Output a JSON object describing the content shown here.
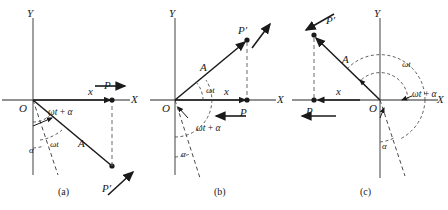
{
  "figure": {
    "background": "#ffffff",
    "ink": "#1a1a1a",
    "axis_color": "#6e6e6e",
    "width": 448,
    "height": 210
  },
  "common": {
    "axis_y_label": "Y",
    "axis_x_label": "X",
    "origin_label": "O",
    "amplitude_label": "A",
    "displacement_label": "x",
    "point_label": "P",
    "rotating_point_label": "P′",
    "angle_omega_t": "ωt",
    "angle_omega_t_plus_alpha": "ωt + α",
    "angle_alpha": "α"
  },
  "panels": [
    {
      "id": "a",
      "caption": "(a)",
      "origin_label": "O",
      "y_label": "Y",
      "x_label": "X",
      "amplitude_label": "A",
      "displacement_label": "x",
      "point_label": "P",
      "rotating_point_label": "P′",
      "angles": [
        {
          "name": "omega-t-plus-alpha",
          "label": "ωt + α"
        },
        {
          "name": "omega-t",
          "label": "ωt"
        },
        {
          "name": "alpha",
          "label": "α"
        }
      ],
      "phasor_quadrant": "fourth",
      "phasor_angle_deg": -52,
      "velocity_arrow_direction": "right",
      "tangent_arrow_direction": "up-right"
    },
    {
      "id": "b",
      "caption": "(b)",
      "origin_label": "O",
      "y_label": "Y",
      "x_label": "X",
      "amplitude_label": "A",
      "displacement_label": "x",
      "point_label": "P",
      "rotating_point_label": "P′",
      "angles": [
        {
          "name": "omega-t",
          "label": "ωt"
        },
        {
          "name": "omega-t-plus-alpha",
          "label": "ωt + α"
        },
        {
          "name": "alpha",
          "label": "α"
        }
      ],
      "phasor_quadrant": "first",
      "phasor_angle_deg": 41,
      "velocity_arrow_direction": "left",
      "tangent_arrow_direction": "up-right"
    },
    {
      "id": "c",
      "caption": "(c)",
      "origin_label": "O",
      "y_label": "Y",
      "x_label": "X",
      "amplitude_label": "A",
      "displacement_label": "x",
      "point_label": "P",
      "rotating_point_label": "P′",
      "angles": [
        {
          "name": "omega-t",
          "label": "ωt"
        },
        {
          "name": "omega-t-plus-alpha",
          "label": "ωt + α"
        },
        {
          "name": "alpha",
          "label": "α"
        }
      ],
      "phasor_quadrant": "second",
      "phasor_angle_deg": 140,
      "velocity_arrow_direction": "left",
      "tangent_arrow_direction": "up-left"
    }
  ]
}
